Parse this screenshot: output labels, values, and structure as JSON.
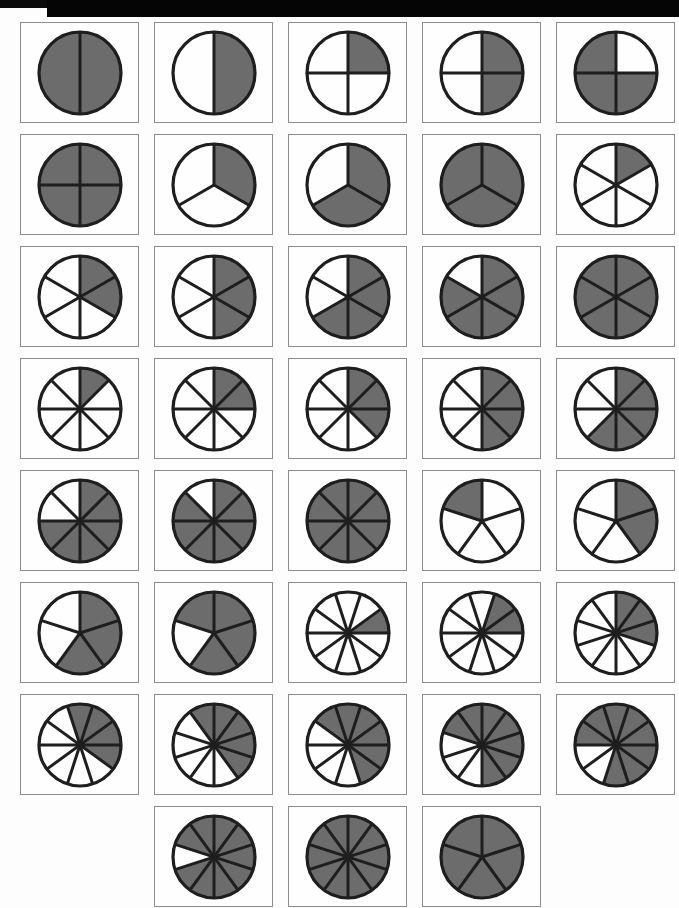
{
  "page": {
    "width": 679,
    "height": 908,
    "background_color": "#fdfdfd",
    "scan_bar_color": "#050505"
  },
  "style": {
    "shaded_color": "#6c6c6c",
    "unshaded_color": "#fefefe",
    "circle_stroke_color": "#1e1e1e",
    "cell_border_color": "#8d8d8d"
  },
  "grid": {
    "columns": 5,
    "rows": 8,
    "cell_width": 119,
    "cell_height": 101,
    "col_pitch": 134,
    "row_pitch": 112,
    "origin_x": 20,
    "origin_y": 22
  },
  "chart_data": {
    "type": "pie",
    "xlabel": "",
    "ylabel": "",
    "legend": [],
    "figures": [
      {
        "row": 1,
        "col": 1,
        "denominator": 2,
        "numerator": 2,
        "fraction": "2/2",
        "fraction_value": 1.0,
        "start_angle": 0
      },
      {
        "row": 1,
        "col": 2,
        "denominator": 2,
        "numerator": 1,
        "fraction": "1/2",
        "fraction_value": 0.5,
        "start_angle": 0
      },
      {
        "row": 1,
        "col": 3,
        "denominator": 4,
        "numerator": 1,
        "fraction": "1/4",
        "fraction_value": 0.25,
        "start_angle": 0
      },
      {
        "row": 1,
        "col": 4,
        "denominator": 4,
        "numerator": 2,
        "fraction": "2/4",
        "fraction_value": 0.5,
        "start_angle": 0
      },
      {
        "row": 1,
        "col": 5,
        "denominator": 4,
        "numerator": 3,
        "fraction": "3/4",
        "fraction_value": 0.75,
        "start_angle": 90
      },
      {
        "row": 2,
        "col": 1,
        "denominator": 4,
        "numerator": 4,
        "fraction": "4/4",
        "fraction_value": 1.0,
        "start_angle": 0
      },
      {
        "row": 2,
        "col": 2,
        "denominator": 3,
        "numerator": 1,
        "fraction": "1/3",
        "fraction_value": 0.333,
        "start_angle": 0
      },
      {
        "row": 2,
        "col": 3,
        "denominator": 3,
        "numerator": 2,
        "fraction": "2/3",
        "fraction_value": 0.667,
        "start_angle": 0
      },
      {
        "row": 2,
        "col": 4,
        "denominator": 3,
        "numerator": 3,
        "fraction": "3/3",
        "fraction_value": 1.0,
        "start_angle": 0
      },
      {
        "row": 2,
        "col": 5,
        "denominator": 6,
        "numerator": 1,
        "fraction": "1/6",
        "fraction_value": 0.167,
        "start_angle": 0
      },
      {
        "row": 3,
        "col": 1,
        "denominator": 6,
        "numerator": 2,
        "fraction": "2/6",
        "fraction_value": 0.333,
        "start_angle": 0
      },
      {
        "row": 3,
        "col": 2,
        "denominator": 6,
        "numerator": 3,
        "fraction": "3/6",
        "fraction_value": 0.5,
        "start_angle": 0
      },
      {
        "row": 3,
        "col": 3,
        "denominator": 6,
        "numerator": 4,
        "fraction": "4/6",
        "fraction_value": 0.667,
        "start_angle": 0
      },
      {
        "row": 3,
        "col": 4,
        "denominator": 6,
        "numerator": 5,
        "fraction": "5/6",
        "fraction_value": 0.833,
        "start_angle": 0
      },
      {
        "row": 3,
        "col": 5,
        "denominator": 6,
        "numerator": 6,
        "fraction": "6/6",
        "fraction_value": 1.0,
        "start_angle": 0
      },
      {
        "row": 4,
        "col": 1,
        "denominator": 8,
        "numerator": 1,
        "fraction": "1/8",
        "fraction_value": 0.125,
        "start_angle": 0
      },
      {
        "row": 4,
        "col": 2,
        "denominator": 8,
        "numerator": 2,
        "fraction": "2/8",
        "fraction_value": 0.25,
        "start_angle": 0
      },
      {
        "row": 4,
        "col": 3,
        "denominator": 8,
        "numerator": 3,
        "fraction": "3/8",
        "fraction_value": 0.375,
        "start_angle": 0
      },
      {
        "row": 4,
        "col": 4,
        "denominator": 8,
        "numerator": 4,
        "fraction": "4/8",
        "fraction_value": 0.5,
        "start_angle": 0
      },
      {
        "row": 4,
        "col": 5,
        "denominator": 8,
        "numerator": 5,
        "fraction": "5/8",
        "fraction_value": 0.625,
        "start_angle": 0
      },
      {
        "row": 5,
        "col": 1,
        "denominator": 8,
        "numerator": 6,
        "fraction": "6/8",
        "fraction_value": 0.75,
        "start_angle": 0
      },
      {
        "row": 5,
        "col": 2,
        "denominator": 8,
        "numerator": 7,
        "fraction": "7/8",
        "fraction_value": 0.875,
        "start_angle": 0
      },
      {
        "row": 5,
        "col": 3,
        "denominator": 8,
        "numerator": 8,
        "fraction": "8/8",
        "fraction_value": 1.0,
        "start_angle": 0
      },
      {
        "row": 5,
        "col": 4,
        "denominator": 5,
        "numerator": 1,
        "fraction": "1/5",
        "fraction_value": 0.2,
        "start_angle": -72
      },
      {
        "row": 5,
        "col": 5,
        "denominator": 5,
        "numerator": 2,
        "fraction": "2/5",
        "fraction_value": 0.4,
        "start_angle": 0
      },
      {
        "row": 6,
        "col": 1,
        "denominator": 5,
        "numerator": 3,
        "fraction": "3/5",
        "fraction_value": 0.6,
        "start_angle": 0
      },
      {
        "row": 6,
        "col": 2,
        "denominator": 5,
        "numerator": 4,
        "fraction": "4/5",
        "fraction_value": 0.8,
        "start_angle": -72
      },
      {
        "row": 6,
        "col": 3,
        "denominator": 10,
        "numerator": 1,
        "fraction": "1/10",
        "fraction_value": 0.1,
        "start_angle": 54
      },
      {
        "row": 6,
        "col": 4,
        "denominator": 10,
        "numerator": 2,
        "fraction": "2/10",
        "fraction_value": 0.2,
        "start_angle": 18
      },
      {
        "row": 6,
        "col": 5,
        "denominator": 10,
        "numerator": 3,
        "fraction": "3/10",
        "fraction_value": 0.3,
        "start_angle": 0
      },
      {
        "row": 7,
        "col": 1,
        "denominator": 10,
        "numerator": 4,
        "fraction": "4/10",
        "fraction_value": 0.4,
        "start_angle": -18
      },
      {
        "row": 7,
        "col": 2,
        "denominator": 10,
        "numerator": 5,
        "fraction": "5/10",
        "fraction_value": 0.5,
        "start_angle": -36
      },
      {
        "row": 7,
        "col": 3,
        "denominator": 10,
        "numerator": 6,
        "fraction": "6/10",
        "fraction_value": 0.6,
        "start_angle": -54
      },
      {
        "row": 7,
        "col": 4,
        "denominator": 10,
        "numerator": 7,
        "fraction": "7/10",
        "fraction_value": 0.7,
        "start_angle": -72
      },
      {
        "row": 7,
        "col": 5,
        "denominator": 10,
        "numerator": 8,
        "fraction": "8/10",
        "fraction_value": 0.8,
        "start_angle": -90
      },
      {
        "row": 8,
        "col": 2,
        "denominator": 10,
        "numerator": 9,
        "fraction": "9/10",
        "fraction_value": 0.9,
        "start_angle": -72
      },
      {
        "row": 8,
        "col": 3,
        "denominator": 10,
        "numerator": 10,
        "fraction": "10/10",
        "fraction_value": 1.0,
        "start_angle": 0
      },
      {
        "row": 8,
        "col": 4,
        "denominator": 5,
        "numerator": 5,
        "fraction": "5/5",
        "fraction_value": 1.0,
        "start_angle": 0
      }
    ]
  }
}
